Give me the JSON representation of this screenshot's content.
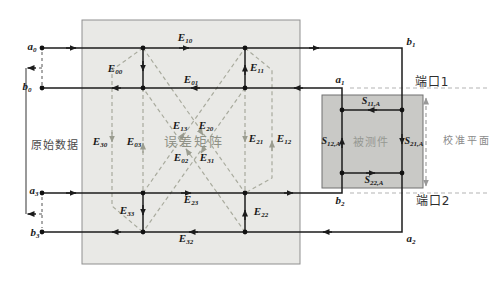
{
  "labels": {
    "error_matrix": "误差矩阵",
    "dut": "被测件",
    "raw_data": "原始数据",
    "port1": "端口1",
    "port2": "端口2",
    "cal_plane": "校准平面"
  },
  "waves": {
    "a0": {
      "base": "a",
      "sub": "0"
    },
    "b0": {
      "base": "b",
      "sub": "0"
    },
    "a3": {
      "base": "a",
      "sub": "3"
    },
    "b3": {
      "base": "b",
      "sub": "3"
    },
    "b1": {
      "base": "b",
      "sub": "1"
    },
    "a1": {
      "base": "a",
      "sub": "1"
    },
    "b2": {
      "base": "b",
      "sub": "2"
    },
    "a2": {
      "base": "a",
      "sub": "2"
    }
  },
  "error_terms": {
    "E10": {
      "base": "E",
      "sub": "10"
    },
    "E00": {
      "base": "E",
      "sub": "00"
    },
    "E01": {
      "base": "E",
      "sub": "01"
    },
    "E11": {
      "base": "E",
      "sub": "11"
    },
    "E30": {
      "base": "E",
      "sub": "30"
    },
    "E03": {
      "base": "E",
      "sub": "03"
    },
    "E13": {
      "base": "E",
      "sub": "13"
    },
    "E20": {
      "base": "E",
      "sub": "20"
    },
    "E02": {
      "base": "E",
      "sub": "02"
    },
    "E31": {
      "base": "E",
      "sub": "31"
    },
    "E21": {
      "base": "E",
      "sub": "21"
    },
    "E12": {
      "base": "E",
      "sub": "12"
    },
    "E23": {
      "base": "E",
      "sub": "23"
    },
    "E33": {
      "base": "E",
      "sub": "33"
    },
    "E22": {
      "base": "E",
      "sub": "22"
    },
    "E32": {
      "base": "E",
      "sub": "32"
    }
  },
  "s_params": {
    "S11": {
      "base": "S",
      "sub": "11,A"
    },
    "S12": {
      "base": "S",
      "sub": "12,A"
    },
    "S21": {
      "base": "S",
      "sub": "21,A"
    },
    "S22": {
      "base": "S",
      "sub": "22,A"
    }
  },
  "colors": {
    "line": "#1c1c1c",
    "leak_dash": "#a9ab9e",
    "port_dash": "#b3b3b3",
    "error_box_fill": "#e9e9e6",
    "dut_box_fill": "#c9c9c6"
  }
}
